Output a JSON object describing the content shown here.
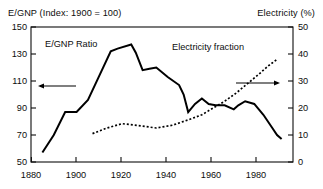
{
  "chart_data": {
    "type": "line",
    "title": "",
    "left_axis": {
      "label": "E/GNP (Index: 1900 = 100)",
      "ticks": [
        "150",
        "130",
        "110",
        "90",
        "70",
        "50"
      ],
      "ylim": [
        50,
        150
      ],
      "arrow": "left-arrow-to-left-axis"
    },
    "right_axis": {
      "label": "Electricity (%)",
      "ticks": [
        "50",
        "40",
        "30",
        "20",
        "10",
        "0"
      ],
      "ylim": [
        0,
        50
      ],
      "arrow": "right-arrow-to-right-axis"
    },
    "xlabel": "",
    "xticks": [
      "1880",
      "1900",
      "1920",
      "1940",
      "1960",
      "1980"
    ],
    "xlim": [
      1875,
      1990
    ],
    "grid": false,
    "legend_position": "in-plot-annotations",
    "series": [
      {
        "name": "E/GNP Ratio",
        "axis": "left",
        "style": "solid",
        "x": [
          1880,
          1885,
          1890,
          1895,
          1900,
          1905,
          1910,
          1913,
          1919,
          1921,
          1924,
          1927,
          1930,
          1935,
          1940,
          1942,
          1944,
          1947,
          1950,
          1953,
          1956,
          1960,
          1964,
          1966,
          1969,
          1973,
          1977,
          1981,
          1983,
          1985
        ],
        "values": [
          57,
          70,
          87,
          87,
          96,
          114,
          132,
          134,
          137,
          131,
          118,
          119,
          120,
          113,
          107,
          100,
          87,
          93,
          97,
          93,
          92,
          92,
          89,
          92,
          95,
          93,
          85,
          75,
          70,
          67
        ]
      },
      {
        "name": "Electricity fraction",
        "axis": "right",
        "style": "dotted",
        "x": [
          1902,
          1908,
          1915,
          1922,
          1930,
          1937,
          1944,
          1950,
          1955,
          1960,
          1965,
          1970,
          1975,
          1979,
          1983
        ],
        "values": [
          10.5,
          12.5,
          14.2,
          13.5,
          12.6,
          13.6,
          15.6,
          17.5,
          20.0,
          22.5,
          25.5,
          29.0,
          32.5,
          35.5,
          38.0
        ]
      }
    ],
    "annotations": [
      {
        "name": "egnp-series-label",
        "text": "E/GNP Ratio"
      },
      {
        "name": "electricity-series-label",
        "text": "Electricity fraction"
      }
    ]
  },
  "labels": {
    "left_axis_title": "E/GNP (Index: 1900 = 100)",
    "right_axis_title": "Electricity (%)",
    "series_solid": "E/GNP Ratio",
    "series_dotted": "Electricity fraction",
    "left_ticks": [
      "150",
      "130",
      "110",
      "90",
      "70",
      "50"
    ],
    "right_ticks": [
      "50",
      "40",
      "30",
      "20",
      "10",
      "0"
    ],
    "x_ticks": [
      "1880",
      "1900",
      "1920",
      "1940",
      "1960",
      "1980"
    ]
  },
  "colors": {
    "ink": "#0d0d0d",
    "background": "#ffffff",
    "series": "#000000"
  }
}
